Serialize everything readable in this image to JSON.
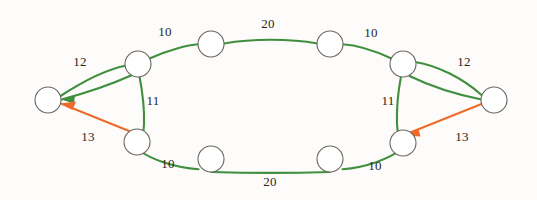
{
  "diagram": {
    "type": "network-graph",
    "title": "",
    "colors": {
      "green_edge": "#3f8f3f",
      "orange_edge": "#ef6a28",
      "node_stroke": "#6b6660",
      "node_fill": "#ffffff",
      "background": "#fdfcfa",
      "label_text": "#2a2724"
    },
    "nodes": [
      {
        "id": "L",
        "name": "left-terminal-node",
        "cx": 48,
        "cy": 100,
        "r": 13
      },
      {
        "id": "TL",
        "name": "top-left-hub-node",
        "cx": 138,
        "cy": 64,
        "r": 13
      },
      {
        "id": "T1",
        "name": "top-node-1",
        "cx": 211,
        "cy": 44,
        "r": 13
      },
      {
        "id": "T2",
        "name": "top-node-2",
        "cx": 330,
        "cy": 44,
        "r": 13
      },
      {
        "id": "TR",
        "name": "top-right-hub-node",
        "cx": 403,
        "cy": 64,
        "r": 13
      },
      {
        "id": "R",
        "name": "right-terminal-node",
        "cx": 494,
        "cy": 100,
        "r": 13
      },
      {
        "id": "BL",
        "name": "bottom-left-hub-node",
        "cx": 137,
        "cy": 142,
        "r": 13
      },
      {
        "id": "B1",
        "name": "bottom-node-1",
        "cx": 211,
        "cy": 159,
        "r": 13
      },
      {
        "id": "B2",
        "name": "bottom-node-2",
        "cx": 330,
        "cy": 159,
        "r": 13
      },
      {
        "id": "BR",
        "name": "bottom-right-hub-node",
        "cx": 403,
        "cy": 143,
        "r": 13
      }
    ],
    "edges": [
      {
        "id": "e1",
        "name": "edge-left-to-top-left",
        "from": "L",
        "to": "TL",
        "weight": "12",
        "color": "green",
        "arrow": false
      },
      {
        "id": "e2",
        "name": "edge-top-left-to-left",
        "from": "TL",
        "to": "L",
        "weight": "",
        "color": "green",
        "arrow": true
      },
      {
        "id": "e3",
        "name": "edge-top-left-to-top-node-1",
        "from": "TL",
        "to": "T1",
        "weight": "10",
        "color": "green",
        "arrow": false
      },
      {
        "id": "e4",
        "name": "edge-top-node-1-to-top-node-2",
        "from": "T1",
        "to": "T2",
        "weight": "20",
        "color": "green",
        "arrow": false
      },
      {
        "id": "e5",
        "name": "edge-top-node-2-to-top-right",
        "from": "T2",
        "to": "TR",
        "weight": "10",
        "color": "green",
        "arrow": false
      },
      {
        "id": "e6",
        "name": "edge-top-right-to-right",
        "from": "TR",
        "to": "R",
        "weight": "12",
        "color": "green",
        "arrow": false
      },
      {
        "id": "e7",
        "name": "edge-top-left-to-bottom-left",
        "from": "TL",
        "to": "BL",
        "weight": "11",
        "color": "green",
        "arrow": false
      },
      {
        "id": "e8",
        "name": "edge-top-right-to-bottom-right",
        "from": "TR",
        "to": "BR",
        "weight": "11",
        "color": "green",
        "arrow": false
      },
      {
        "id": "e9",
        "name": "edge-bottom-left-to-bottom-node-1",
        "from": "BL",
        "to": "B1",
        "weight": "10",
        "color": "green",
        "arrow": false
      },
      {
        "id": "e10",
        "name": "edge-bottom-node-1-to-bottom-node-2",
        "from": "B1",
        "to": "B2",
        "weight": "20",
        "color": "green",
        "arrow": false
      },
      {
        "id": "e11",
        "name": "edge-bottom-node-2-to-bottom-right",
        "from": "B2",
        "to": "BR",
        "weight": "10",
        "color": "green",
        "arrow": false
      },
      {
        "id": "e12",
        "name": "edge-bottom-left-to-left-arrow",
        "from": "BL",
        "to": "L",
        "weight": "13",
        "color": "orange",
        "arrow": true
      },
      {
        "id": "e13",
        "name": "edge-right-to-bottom-right-arrow",
        "from": "R",
        "to": "BR",
        "weight": "13",
        "color": "orange",
        "arrow": true
      }
    ],
    "labels": [
      {
        "name": "label-top-left-10",
        "text": "10",
        "x": 165,
        "y": 32
      },
      {
        "name": "label-top-20",
        "text": "20",
        "x": 268,
        "y": 24
      },
      {
        "name": "label-top-right-10",
        "text": "10",
        "x": 371,
        "y": 33
      },
      {
        "name": "label-left-12",
        "text": "12",
        "x": 80,
        "y": 62
      },
      {
        "name": "label-right-12",
        "text": "12",
        "x": 464,
        "y": 62
      },
      {
        "name": "label-left-11",
        "text": "11",
        "x": 153,
        "y": 101
      },
      {
        "name": "label-right-11",
        "text": "11",
        "x": 388,
        "y": 101
      },
      {
        "name": "label-left-13",
        "text": "13",
        "x": 88,
        "y": 137
      },
      {
        "name": "label-right-13",
        "text": "13",
        "x": 462,
        "y": 137
      },
      {
        "name": "label-bottom-left-10",
        "text": "10",
        "x": 168,
        "y": 164
      },
      {
        "name": "label-bottom-20",
        "text": "20",
        "x": 270,
        "y": 182
      },
      {
        "name": "label-bottom-right-10",
        "text": "10",
        "x": 375,
        "y": 166
      }
    ]
  }
}
